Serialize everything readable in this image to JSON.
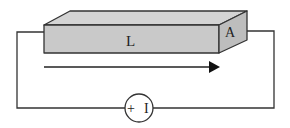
{
  "diagram": {
    "conductor": {
      "length_label": "L",
      "area_label": "A",
      "fill_color": "#c9c9c9",
      "stroke_color": "#333333"
    },
    "current_arrow": {
      "direction": "left-to-right"
    },
    "battery": {
      "symbol": "+ I",
      "plus": "+",
      "minus": "I"
    },
    "wire_color": "#333333"
  }
}
